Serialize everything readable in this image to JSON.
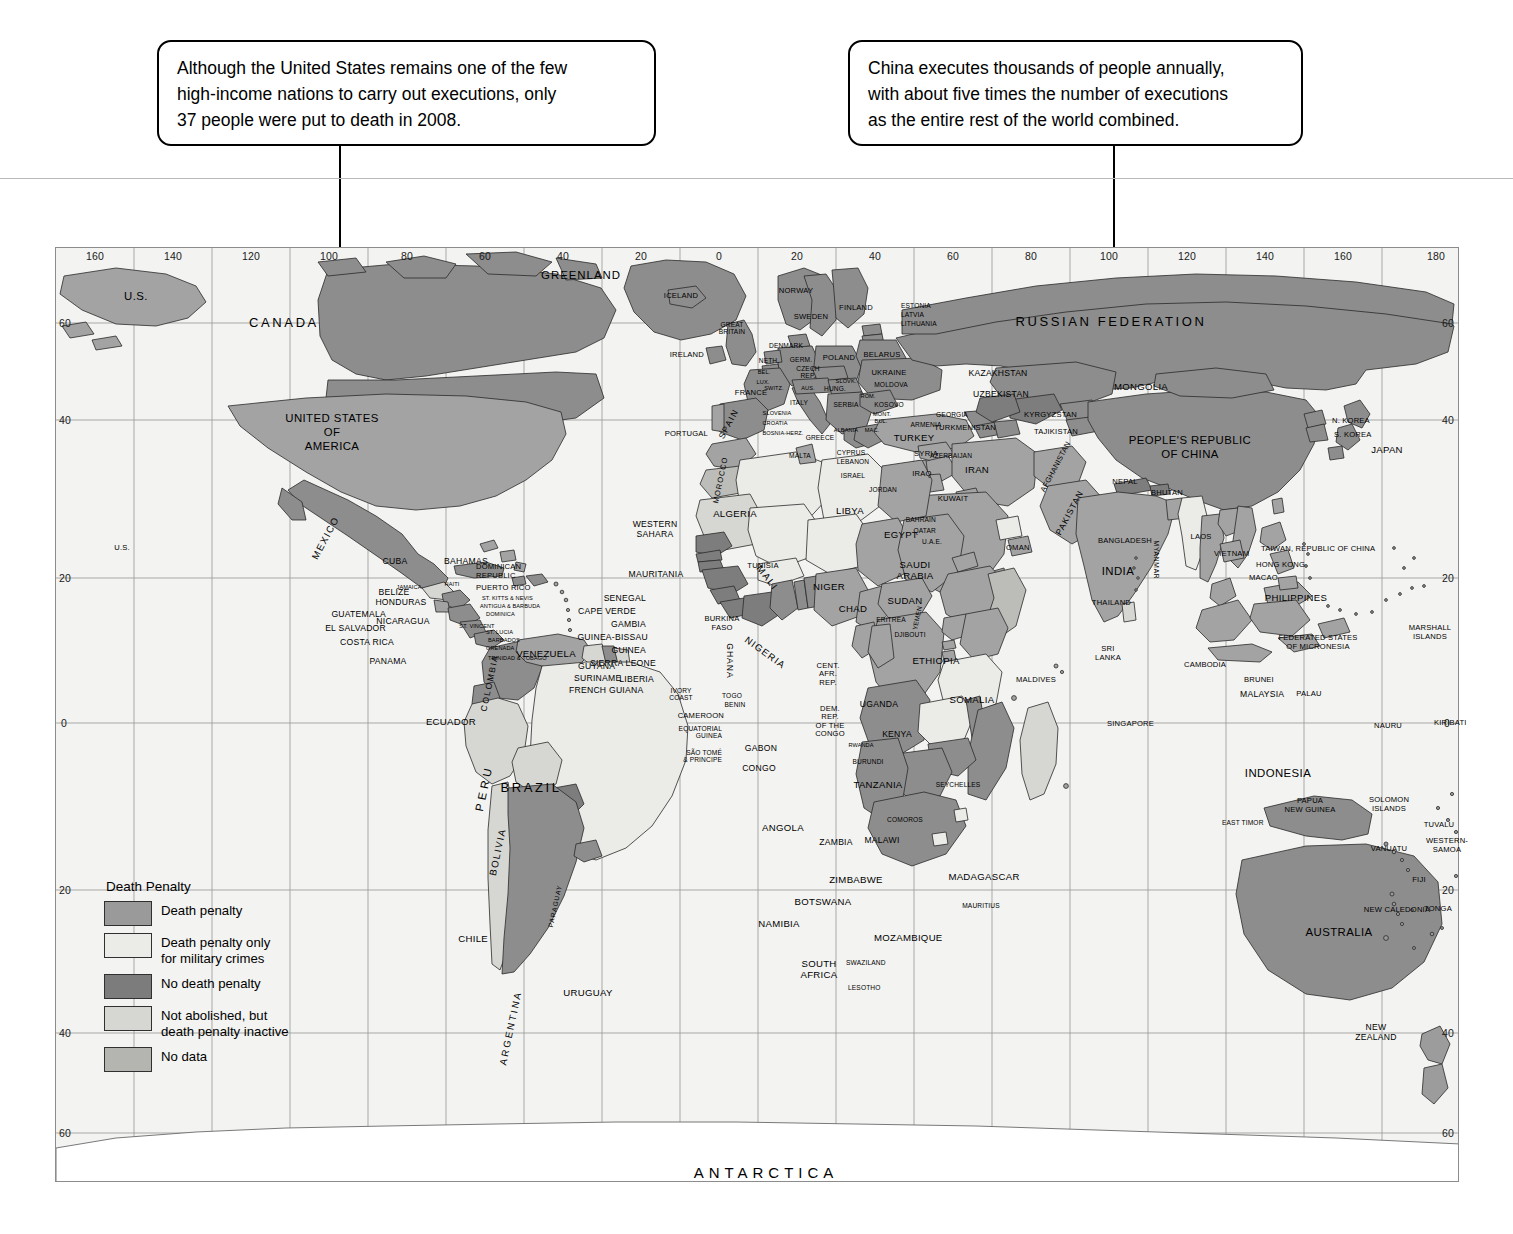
{
  "callouts": [
    {
      "id": "us-callout",
      "lines": [
        "Although the United States remains one of the few",
        "high-income nations to carry out executions, only",
        "37 people were put to death in 2008."
      ]
    },
    {
      "id": "china-callout",
      "lines": [
        "China executes thousands of people annually,",
        "with about five times the number of executions",
        "as the entire rest of the world combined."
      ]
    }
  ],
  "legend": {
    "title": "Death Penalty",
    "items": [
      {
        "label": "Death penalty",
        "color": "#9a9a9a"
      },
      {
        "label": "Death penalty only\nfor military crimes",
        "color": "#ebebe8"
      },
      {
        "label": "No death penalty",
        "color": "#7c7c7c"
      },
      {
        "label": "Not abolished, but\ndeath penalty inactive",
        "color": "#d6d6d2"
      },
      {
        "label": "No data",
        "color": "#b4b4b0"
      }
    ]
  },
  "axes": {
    "top": [
      "160",
      "140",
      "120",
      "100",
      "80",
      "60",
      "40",
      "20",
      "0",
      "20",
      "40",
      "60",
      "80",
      "100",
      "120",
      "140",
      "160",
      "180"
    ],
    "left": [
      "60",
      "40",
      "20",
      "0",
      "20",
      "40",
      "60"
    ],
    "right": [
      "60",
      "40",
      "20",
      "0",
      "20",
      "40",
      "60"
    ]
  },
  "labels": {
    "continents": [
      "ANTARCTICA"
    ],
    "north_america": [
      "U.S.",
      "CANADA",
      "GREENLAND",
      "UNITED STATES OF AMERICA",
      "MEXICO",
      "U.S.",
      "CUBA",
      "BAHAMAS",
      "JAMAICA",
      "HAITI",
      "DOMINICAN REPUBLIC",
      "PUERTO RICO",
      "ST. KITTS & NEVIS",
      "ANTIGUA & BARBUDA",
      "DOMINICA",
      "ST. VINCENT",
      "ST. LUCIA",
      "BARBADOS",
      "GRENADA",
      "TRINIDAD & TOBAGO",
      "BELIZE",
      "GUATEMALA",
      "HONDURAS",
      "EL SALVADOR",
      "NICARAGUA",
      "COSTA RICA",
      "PANAMA"
    ],
    "south_america": [
      "VENEZUELA",
      "GUYANA",
      "SURINAME",
      "FRENCH GUIANA",
      "COLOMBIA",
      "ECUADOR",
      "PERU",
      "BRAZIL",
      "BOLIVIA",
      "PARAGUAY",
      "CHILE",
      "ARGENTINA",
      "URUGUAY"
    ],
    "europe": [
      "ICELAND",
      "IRELAND",
      "GREAT BRITAIN",
      "PORTUGAL",
      "SPAIN",
      "FRANCE",
      "NORWAY",
      "SWEDEN",
      "FINLAND",
      "ESTONIA",
      "LATVIA",
      "LITHUANIA",
      "DENMARK",
      "NETH.",
      "GERM.",
      "POLAND",
      "BELARUS",
      "BEL.",
      "LUX.",
      "CZECH REP.",
      "SLOVK.",
      "UKRAINE",
      "MOLDOVA",
      "SWITZ.",
      "AUS.",
      "HUNG.",
      "ROM.",
      "ITALY",
      "SLOVENIA",
      "CROATIA",
      "BOSNIA-HERZ.",
      "SERBIA",
      "KOSOVO",
      "MONT.",
      "ALBANIA",
      "MAC.",
      "BUL.",
      "GREECE",
      "MALTA",
      "CYPRUS",
      "TURKEY",
      "GEORGIA",
      "ARMENIA",
      "AZERBAIJAN"
    ],
    "africa": [
      "MOROCCO",
      "WESTERN SAHARA",
      "ALGERIA",
      "TUNISIA",
      "LIBYA",
      "EGYPT",
      "MAURITANIA",
      "MALI",
      "NIGER",
      "CHAD",
      "SUDAN",
      "ERITREA",
      "DJIBOUTI",
      "ETHIOPIA",
      "SOMALIA",
      "SENEGAL",
      "CAPE VERDE",
      "GAMBIA",
      "GUINEA-BISSAU",
      "GUINEA",
      "SIERRA LEONE",
      "LIBERIA",
      "IVORY COAST",
      "BURKINA FASO",
      "GHANA",
      "TOGO",
      "BENIN",
      "NIGERIA",
      "CAMEROON",
      "EQUATORIAL GUINEA",
      "SÃO TOMÉ & PRINCIPE",
      "GABON",
      "CONGO",
      "CENT. AFR. REP.",
      "DEM. REP. OF THE CONGO",
      "RWANDA",
      "BURUNDI",
      "UGANDA",
      "KENYA",
      "TANZANIA",
      "ANGOLA",
      "ZAMBIA",
      "MALAWI",
      "MOZAMBIQUE",
      "ZIMBABWE",
      "BOTSWANA",
      "NAMIBIA",
      "SOUTH AFRICA",
      "SWAZILAND",
      "LESOTHO",
      "MADAGASCAR",
      "COMOROS",
      "MAURITIUS",
      "SEYCHELLES"
    ],
    "asia": [
      "RUSSIAN FEDERATION",
      "KAZAKHSTAN",
      "UZBEKISTAN",
      "TURKMENISTAN",
      "KYRGYZSTAN",
      "TAJIKISTAN",
      "MONGOLIA",
      "PEOPLE'S REPUBLIC OF CHINA",
      "N. KOREA",
      "S. KOREA",
      "JAPAN",
      "SYRIA",
      "LEBANON",
      "ISRAEL",
      "JORDAN",
      "IRAQ",
      "IRAN",
      "KUWAIT",
      "BAHRAIN",
      "QATAR",
      "U.A.E.",
      "OMAN",
      "SAUDI ARABIA",
      "YEMEN",
      "AFGHANISTAN",
      "PAKISTAN",
      "NEPAL",
      "BHUTAN",
      "INDIA",
      "BANGLADESH",
      "MYANMAR",
      "SRI LANKA",
      "MALDIVES",
      "THAILAND",
      "LAOS",
      "VIETNAM",
      "CAMBODIA",
      "MALAYSIA",
      "SINGAPORE",
      "BRUNEI",
      "INDONESIA",
      "PHILIPPINES",
      "TAIWAN, REPUBLIC OF CHINA",
      "HONG KONG",
      "MACAO",
      "EAST TIMOR"
    ],
    "oceania": [
      "AUSTRALIA",
      "NEW ZEALAND",
      "PAPUA NEW GUINEA",
      "SOLOMON ISLANDS",
      "NEW CALEDONIA",
      "VANUATU",
      "FIJI",
      "TONGA",
      "WESTERN SAMOA",
      "TUVALU",
      "NAURU",
      "KIRIBATI",
      "MARSHALL ISLANDS",
      "FEDERATED STATES OF MICRONESIA",
      "PALAU"
    ]
  }
}
